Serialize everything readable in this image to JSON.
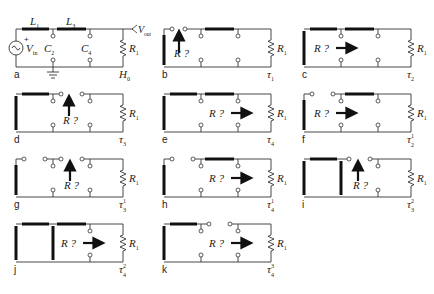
{
  "figure": {
    "components": {
      "inductor_1": "L",
      "inductor_1_sub": "1",
      "inductor_3": "L",
      "inductor_3_sub": "3",
      "cap_2": "C",
      "cap_2_sub": "2",
      "cap_4": "C",
      "cap_4_sub": "4",
      "resistor": "R",
      "resistor_sub": "1",
      "source": "V",
      "source_sub": "in",
      "output": "V",
      "output_sub": "out",
      "source_plus": "+",
      "query": "R ?"
    },
    "panels": [
      {
        "id": "a",
        "tag": "H",
        "tag_sub": "0",
        "tag_sup": ""
      },
      {
        "id": "b",
        "tag": "τ",
        "tag_sub": "1",
        "tag_sup": ""
      },
      {
        "id": "c",
        "tag": "τ",
        "tag_sub": "2",
        "tag_sup": ""
      },
      {
        "id": "d",
        "tag": "τ",
        "tag_sub": "3",
        "tag_sup": ""
      },
      {
        "id": "e",
        "tag": "τ",
        "tag_sub": "4",
        "tag_sup": ""
      },
      {
        "id": "f",
        "tag": "τ",
        "tag_sub": "2",
        "tag_sup": "1"
      },
      {
        "id": "g",
        "tag": "τ",
        "tag_sub": "3",
        "tag_sup": "1"
      },
      {
        "id": "h",
        "tag": "τ",
        "tag_sub": "4",
        "tag_sup": "1"
      },
      {
        "id": "i",
        "tag": "τ",
        "tag_sub": "3",
        "tag_sup": "2"
      },
      {
        "id": "j",
        "tag": "τ",
        "tag_sub": "4",
        "tag_sup": "2"
      },
      {
        "id": "k",
        "tag": "τ",
        "tag_sub": "4",
        "tag_sup": "3"
      }
    ]
  }
}
